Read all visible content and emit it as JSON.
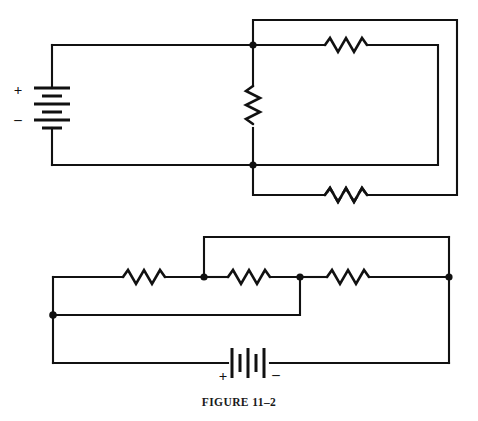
{
  "figure": {
    "caption": "FIGURE 11–2",
    "background_color": "#ffffff",
    "ink_color": "#111111",
    "width": 478,
    "height": 421
  },
  "circuits": [
    {
      "id": "upper-circuit",
      "name": "upper-circuit",
      "source": {
        "type": "battery",
        "orientation": "vertical",
        "cells": 3,
        "plus_label": "+",
        "minus_label": "–",
        "plus_position": "top",
        "minus_position": "bottom"
      },
      "resistors": [
        {
          "id": "r-upper-top",
          "name": "resistor-top-branch",
          "orientation": "horizontal"
        },
        {
          "id": "r-upper-middle",
          "name": "resistor-middle-vertical",
          "orientation": "vertical"
        },
        {
          "id": "r-upper-bottom",
          "name": "resistor-bottom-branch",
          "orientation": "horizontal"
        }
      ],
      "junction_dots": 2
    },
    {
      "id": "lower-circuit",
      "name": "lower-circuit",
      "source": {
        "type": "battery",
        "orientation": "horizontal",
        "cells": 3,
        "plus_label": "+",
        "minus_label": "–",
        "plus_position": "left",
        "minus_position": "right"
      },
      "resistors": [
        {
          "id": "r-lower-1",
          "name": "resistor-left",
          "orientation": "horizontal"
        },
        {
          "id": "r-lower-2",
          "name": "resistor-center",
          "orientation": "horizontal"
        },
        {
          "id": "r-lower-3",
          "name": "resistor-right",
          "orientation": "horizontal"
        }
      ],
      "junction_dots": 4
    }
  ],
  "labels": {
    "upper_plus": "+",
    "upper_minus": "–",
    "lower_plus": "+",
    "lower_minus": "–"
  }
}
